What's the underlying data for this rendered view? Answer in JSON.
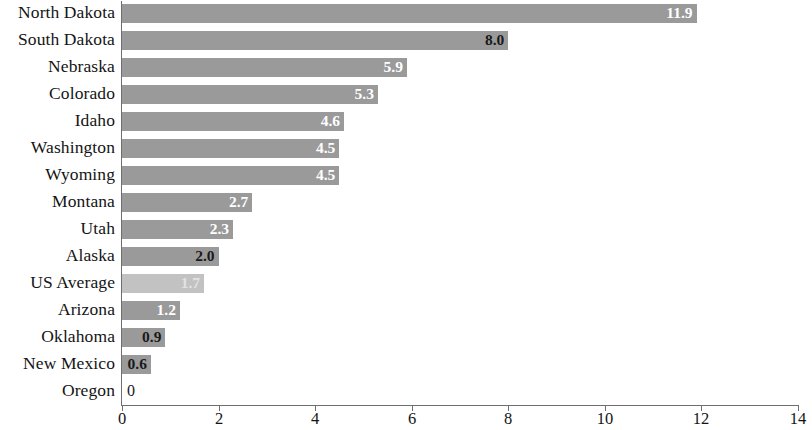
{
  "chart_data": {
    "type": "bar",
    "orientation": "horizontal",
    "title": "",
    "subtitle": "",
    "xlabel": "",
    "ylabel": "",
    "xlim": [
      0,
      14
    ],
    "xticks": [
      0,
      2,
      4,
      6,
      8,
      10,
      12,
      14
    ],
    "xtick_labels": [
      "0",
      "2",
      "4",
      "6",
      "8",
      "10",
      "12",
      "14"
    ],
    "grid": false,
    "legend": null,
    "colors": {
      "bar": "#9a9a9a",
      "bar_highlight": "#c2c2c2",
      "axis": "#6f6f6f",
      "text": "#141414",
      "value_label_light": "#ffffff",
      "value_label_dark": "#1a1a1a"
    },
    "categories": [
      "North Dakota",
      "South Dakota",
      "Nebraska",
      "Colorado",
      "Idaho",
      "Washington",
      "Wyoming",
      "Montana",
      "Utah",
      "Alaska",
      "US Average",
      "Arizona",
      "Oklahoma",
      "New Mexico",
      "Oregon"
    ],
    "values": [
      11.9,
      8.0,
      5.9,
      5.3,
      4.6,
      4.5,
      4.5,
      2.7,
      2.3,
      2.0,
      1.7,
      1.2,
      0.9,
      0.6,
      0
    ],
    "value_labels": [
      "11.9",
      "8.0",
      "5.9",
      "5.3",
      "4.6",
      "4.5",
      "4.5",
      "2.7",
      "2.3",
      "2.0",
      "1.7",
      "1.2",
      "0.9",
      "0.6",
      "0"
    ],
    "bars": [
      {
        "category": "North Dakota",
        "value": 11.9,
        "label": "11.9",
        "style": "normal",
        "label_color": "light",
        "label_inside": true
      },
      {
        "category": "South Dakota",
        "value": 8.0,
        "label": "8.0",
        "style": "normal",
        "label_color": "dark",
        "label_inside": true
      },
      {
        "category": "Nebraska",
        "value": 5.9,
        "label": "5.9",
        "style": "normal",
        "label_color": "light",
        "label_inside": true
      },
      {
        "category": "Colorado",
        "value": 5.3,
        "label": "5.3",
        "style": "normal",
        "label_color": "light",
        "label_inside": true
      },
      {
        "category": "Idaho",
        "value": 4.6,
        "label": "4.6",
        "style": "normal",
        "label_color": "light",
        "label_inside": true
      },
      {
        "category": "Washington",
        "value": 4.5,
        "label": "4.5",
        "style": "normal",
        "label_color": "light",
        "label_inside": true
      },
      {
        "category": "Wyoming",
        "value": 4.5,
        "label": "4.5",
        "style": "normal",
        "label_color": "light",
        "label_inside": true
      },
      {
        "category": "Montana",
        "value": 2.7,
        "label": "2.7",
        "style": "normal",
        "label_color": "light",
        "label_inside": true
      },
      {
        "category": "Utah",
        "value": 2.3,
        "label": "2.3",
        "style": "normal",
        "label_color": "light",
        "label_inside": true
      },
      {
        "category": "Alaska",
        "value": 2.0,
        "label": "2.0",
        "style": "normal",
        "label_color": "dark",
        "label_inside": true
      },
      {
        "category": "US Average",
        "value": 1.7,
        "label": "1.7",
        "style": "light",
        "label_color": "faint",
        "label_inside": true
      },
      {
        "category": "Arizona",
        "value": 1.2,
        "label": "1.2",
        "style": "normal",
        "label_color": "light",
        "label_inside": true
      },
      {
        "category": "Oklahoma",
        "value": 0.9,
        "label": "0.9",
        "style": "normal",
        "label_color": "dark",
        "label_inside": true
      },
      {
        "category": "New Mexico",
        "value": 0.6,
        "label": "0.6",
        "style": "normal",
        "label_color": "dark",
        "label_inside": true
      },
      {
        "category": "Oregon",
        "value": 0,
        "label": "0",
        "style": "normal",
        "label_color": "dark",
        "label_inside": false
      }
    ]
  }
}
